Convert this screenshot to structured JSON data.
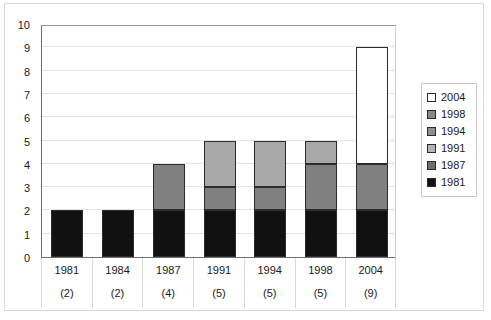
{
  "chart_data": {
    "type": "bar",
    "subtype": "stacked-bar",
    "title": "",
    "xlabel": "",
    "ylabel": "",
    "ylim": [
      0,
      10
    ],
    "yticks": [
      0,
      1,
      2,
      3,
      4,
      5,
      6,
      7,
      8,
      9,
      10
    ],
    "ytick_labels": [
      "0",
      "1",
      "2",
      "3",
      "4",
      "5",
      "6",
      "7",
      "8",
      "9",
      "10"
    ],
    "grid": true,
    "grid_axis": "y",
    "legend_position": "right",
    "categories": [
      "1981",
      "1984",
      "1987",
      "1991",
      "1994",
      "1998",
      "2004"
    ],
    "category_sublabels": [
      "(2)",
      "(2)",
      "(4)",
      "(5)",
      "(5)",
      "(5)",
      "(9)"
    ],
    "category_totals": [
      2,
      2,
      4,
      5,
      5,
      5,
      9
    ],
    "series": [
      {
        "name": "1981",
        "values": [
          2,
          2,
          2,
          2,
          2,
          2,
          2
        ],
        "color": "#111111",
        "swatch": "#111111"
      },
      {
        "name": "1987",
        "values": [
          0,
          0,
          2,
          1,
          1,
          2,
          2
        ],
        "color": "#808080",
        "swatch": "#6e6e6e"
      },
      {
        "name": "1991",
        "values": [
          0,
          0,
          0,
          2,
          2,
          0,
          0
        ],
        "color": "#a8a8a8",
        "swatch": "#b4b4b4"
      },
      {
        "name": "1994",
        "values": [
          0,
          0,
          0,
          0,
          0,
          1,
          0
        ],
        "color": "#a8a8a8",
        "swatch": "#8f8f8f"
      },
      {
        "name": "1998",
        "values": [
          0,
          0,
          0,
          0,
          0,
          0,
          0
        ],
        "color": "#9a9a9a",
        "swatch": "#878787"
      },
      {
        "name": "2004",
        "values": [
          0,
          0,
          0,
          0,
          0,
          0,
          5
        ],
        "color": "#ffffff",
        "swatch": "#ffffff"
      }
    ],
    "legend_entries": [
      {
        "label": "2004",
        "swatch": "#ffffff"
      },
      {
        "label": "1998",
        "swatch": "#878787"
      },
      {
        "label": "1994",
        "swatch": "#8f8f8f"
      },
      {
        "label": "1991",
        "swatch": "#b4b4b4"
      },
      {
        "label": "1987",
        "swatch": "#6e6e6e"
      },
      {
        "label": "1981",
        "swatch": "#111111"
      }
    ],
    "stack_order_bottom_to_top": [
      "1981",
      "1987",
      "1991",
      "1994",
      "1998",
      "2004"
    ],
    "axis_color": "#6f6f6f",
    "gridline_color": "#e3e3e3",
    "border_color": "#2b2b2b"
  }
}
